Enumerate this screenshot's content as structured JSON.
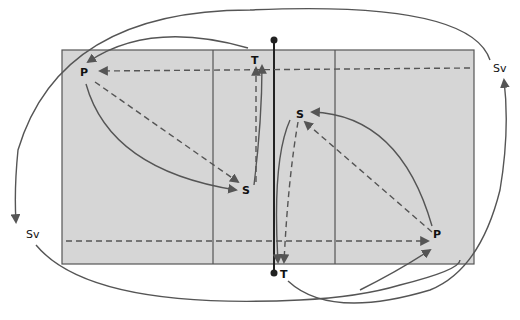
{
  "diagram": {
    "type": "volleyball-court-player-movement",
    "colors": {
      "court_fill": "#d6d6d6",
      "court_border": "#555555",
      "net": "#222222",
      "arrow": "#555555",
      "background": "#ffffff"
    },
    "labels": {
      "left_P": "P",
      "left_S": "S",
      "left_T": "T",
      "right_S": "S",
      "right_P": "P",
      "bottom_T": "T",
      "right_Sv": "Sv",
      "left_Sv": "Sv"
    },
    "legend": {
      "solid": "player movement",
      "dashed": "ball trajectory"
    }
  }
}
